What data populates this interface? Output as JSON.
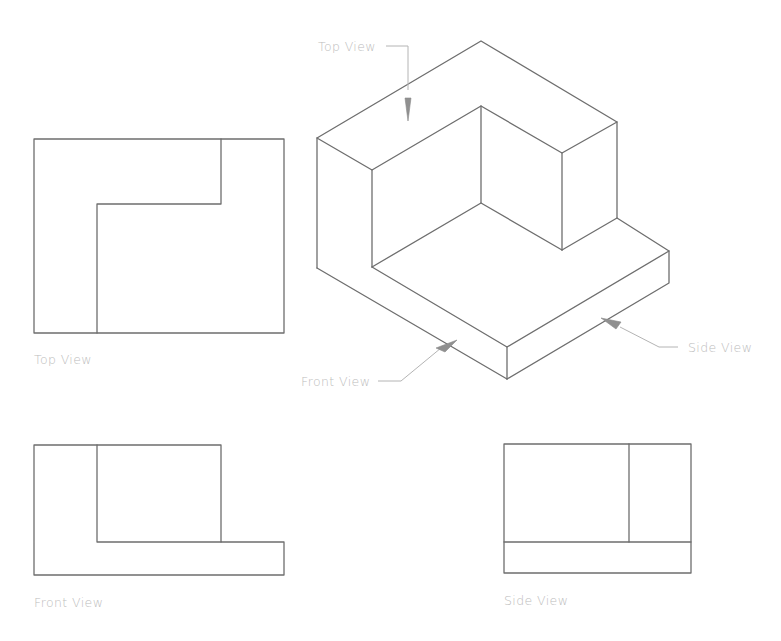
{
  "diagram": {
    "colors": {
      "edge": "#6e6e6e",
      "label": "#bdbdbd",
      "leader": "#b4b4b4",
      "arrow": "#909090",
      "background": "#ffffff"
    },
    "isometric": {
      "callouts": {
        "top": "Top View",
        "front": "Front View",
        "side": "Side View"
      }
    },
    "views": {
      "top": {
        "label": "Top View"
      },
      "front": {
        "label": "Front View"
      },
      "side": {
        "label": "Side View"
      }
    }
  }
}
